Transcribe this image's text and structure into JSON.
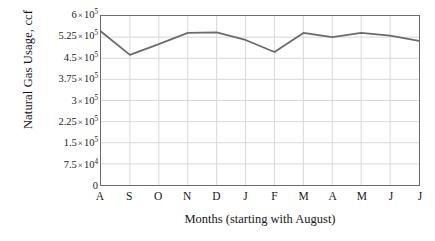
{
  "chart_data": {
    "type": "line",
    "title": "",
    "xlabel": "Months (starting with August)",
    "ylabel": "Natural Gas Usage, ccf",
    "categories": [
      "A",
      "S",
      "O",
      "N",
      "D",
      "J",
      "F",
      "M",
      "A",
      "M",
      "J",
      "J"
    ],
    "category_names": [
      "August",
      "September",
      "October",
      "November",
      "December",
      "January",
      "February",
      "March",
      "April",
      "May",
      "June",
      "July"
    ],
    "values": [
      545000,
      462000,
      500000,
      540000,
      542000,
      515000,
      472000,
      540000,
      525000,
      540000,
      530000,
      512000
    ],
    "series": [
      {
        "name": "Natural Gas Usage",
        "values": [
          545000,
          462000,
          500000,
          540000,
          542000,
          515000,
          472000,
          540000,
          525000,
          540000,
          530000,
          512000
        ]
      }
    ],
    "ylim": [
      0,
      600000
    ],
    "ytick_values": [
      0,
      75000,
      150000,
      225000,
      300000,
      375000,
      450000,
      525000,
      600000
    ],
    "ytick_labels": [
      {
        "mantissa": "0",
        "show_power": false,
        "exponent": "",
        "text": "0"
      },
      {
        "mantissa": "7.5",
        "show_power": true,
        "exponent": "4",
        "text": "7.5 × 10⁴"
      },
      {
        "mantissa": "1.5",
        "show_power": true,
        "exponent": "5",
        "text": "1.5 × 10⁵"
      },
      {
        "mantissa": "2.25",
        "show_power": true,
        "exponent": "5",
        "text": "2.25 × 10⁵"
      },
      {
        "mantissa": "3",
        "show_power": true,
        "exponent": "5",
        "text": "3 × 10⁵"
      },
      {
        "mantissa": "3.75",
        "show_power": true,
        "exponent": "5",
        "text": "3.75 × 10⁵"
      },
      {
        "mantissa": "4.5",
        "show_power": true,
        "exponent": "5",
        "text": "4.5 × 10⁵"
      },
      {
        "mantissa": "5.25",
        "show_power": true,
        "exponent": "5",
        "text": "5.25 × 10⁵"
      },
      {
        "mantissa": "6",
        "show_power": true,
        "exponent": "5",
        "text": "6 × 10⁵"
      }
    ],
    "multiply_symbol": "×",
    "base": "10",
    "grid": true,
    "grid_x": true,
    "grid_y": true,
    "legend": false,
    "legend_position": "none",
    "markers": false,
    "colors": {
      "line": "#6b6b6b",
      "grid": "#d8d8d8",
      "frame": "#6d6d6d",
      "background": "#ffffff",
      "text": "#161616"
    },
    "line_width": 1.8
  }
}
